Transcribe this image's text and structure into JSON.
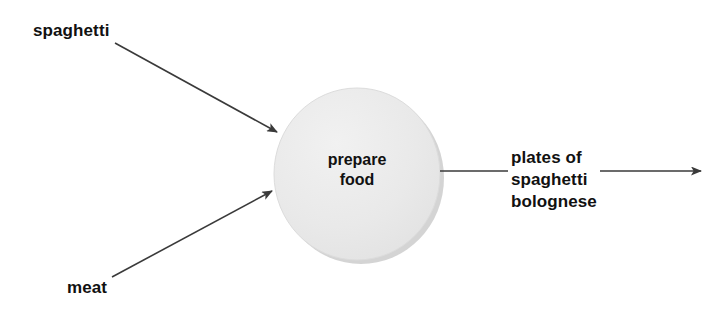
{
  "diagram": {
    "type": "data-flow-diagram",
    "background_color": "#ffffff",
    "process": {
      "name": "prepare food",
      "label_line1": "prepare",
      "label_line2": "food",
      "shape": "circle",
      "fill_color": "#e9e9e9",
      "edge_shadow_color": "#c9c9c9",
      "center_x": 357,
      "center_y": 174,
      "radius_x": 83,
      "radius_y": 86
    },
    "line_color": "#3a3a3a",
    "text_color": "#111111",
    "inputs": [
      {
        "label": "spaghetti",
        "from_x": 115,
        "from_y": 43,
        "to_x": 278,
        "to_y": 133,
        "label_x": 33,
        "label_y": 20
      },
      {
        "label": "meat",
        "from_x": 112,
        "from_y": 277,
        "to_x": 273,
        "to_y": 190,
        "label_x": 67,
        "label_y": 277
      }
    ],
    "outputs": [
      {
        "label_line1": "plates of",
        "label_line2": "spaghetti",
        "label_line3": "bolognese",
        "from_x": 440,
        "from_y": 171,
        "to_x": 702,
        "to_y": 171,
        "label_x": 508,
        "label_y": 147
      }
    ]
  }
}
